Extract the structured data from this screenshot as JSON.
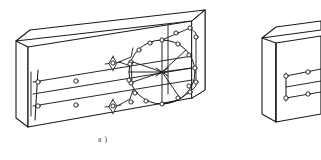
{
  "figure": {
    "kind": "technical-line-drawing",
    "caption": "a )",
    "caption_x": 98,
    "caption_y": 136,
    "background_color": "#ffffff",
    "stroke_color": "#1a1a1a",
    "node_fill_color": "#ffffff",
    "line_width_outline": 1.1,
    "line_width_detail": 0.9,
    "node_radius": 2.1
  },
  "objects": [
    {
      "id": "block-a",
      "label": "a )",
      "front_face": [
        [
          28,
          47
        ],
        [
          192,
          21
        ],
        [
          192,
          98
        ],
        [
          28,
          127
        ]
      ],
      "top_face": [
        [
          28,
          47
        ],
        [
          55,
          33
        ],
        [
          213,
          13
        ],
        [
          192,
          21
        ]
      ],
      "side_face": [
        [
          28,
          47
        ],
        [
          28,
          127
        ],
        [
          16,
          118
        ],
        [
          16,
          41
        ]
      ],
      "notes": "main slab shown in full with circular raceway loop"
    },
    {
      "id": "block-b",
      "label": "",
      "front_face": [
        [
          276,
          43
        ],
        [
          321,
          36
        ],
        [
          321,
          110
        ],
        [
          276,
          122
        ]
      ],
      "top_face": [
        [
          276,
          43
        ],
        [
          290,
          31
        ],
        [
          321,
          27
        ],
        [
          321,
          36
        ]
      ],
      "side_face": [
        [
          262,
          38
        ],
        [
          276,
          43
        ],
        [
          276,
          122
        ],
        [
          262,
          114
        ]
      ],
      "notes": "second slab, cropped at right image edge"
    }
  ],
  "network": {
    "conduit_runs": [
      {
        "name": "upper-run",
        "from": [
          36,
          82
        ],
        "to": [
          192,
          56
        ]
      },
      {
        "name": "middle-run",
        "from": [
          36,
          94
        ],
        "to": [
          192,
          68
        ]
      },
      {
        "name": "lower-run",
        "from": [
          36,
          106
        ],
        "to": [
          192,
          80
        ]
      }
    ],
    "riser_bars": [
      {
        "name": "left-riser",
        "x_top": [
          37,
          72
        ],
        "x_bottom": [
          33,
          118
        ]
      }
    ],
    "star_junctions": [
      {
        "name": "star-upper",
        "cx": 113,
        "cy": 63,
        "size": 6
      },
      {
        "name": "star-lower",
        "cx": 113,
        "cy": 106,
        "size": 6
      }
    ],
    "loop": {
      "name": "circular-raceway",
      "center": [
        162,
        72
      ],
      "rx": 33,
      "ry": 32,
      "node_count": 18,
      "spoke_count": 6
    },
    "node_count_total": 34
  },
  "icons": {
    "node": "junction-node-icon",
    "star": "star-junction-icon",
    "loop": "circular-raceway-icon"
  }
}
